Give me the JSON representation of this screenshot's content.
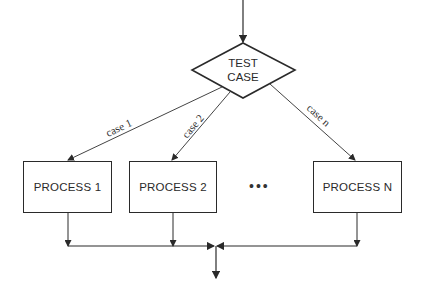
{
  "diagram": {
    "type": "flowchart-case-structure",
    "decision": {
      "line1": "TEST",
      "line2": "CASE"
    },
    "branches": [
      {
        "label": "case 1",
        "process": "PROCESS 1"
      },
      {
        "label": "case 2",
        "process": "PROCESS 2"
      },
      {
        "label": "case n",
        "process": "PROCESS N"
      }
    ],
    "ellipsis": "•••",
    "colors": {
      "stroke": "#2a2a2a",
      "background": "#ffffff"
    }
  }
}
